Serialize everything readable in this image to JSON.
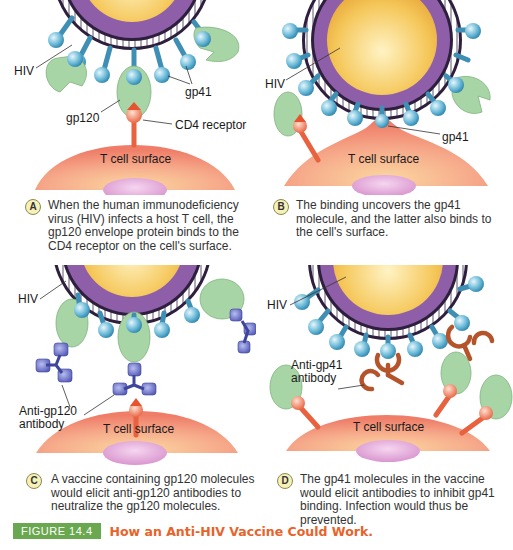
{
  "figure": {
    "number": "FIGURE 14.4",
    "title": "How an Anti-HIV Vaccine Could Work.",
    "colors": {
      "figure_number_bg": "#6aa84f",
      "title_text": "#e8632a",
      "virus_core": "#f5c75a",
      "virus_envelope": "#8e5fa8",
      "gp41": "#5aaed0",
      "gp120": "#a8d5a6",
      "cd4_receptor": "#f07a5a",
      "t_cell": "#f3937a",
      "nucleus": "#e6a6dc",
      "anti_gp120_antibody": "#6e74c8",
      "anti_gp41_antibody": "#b5532a"
    }
  },
  "panels": [
    {
      "id": "A",
      "labels": {
        "hiv": "HIV",
        "gp41": "gp41",
        "gp120": "gp120",
        "cd4": "CD4 receptor",
        "tcell": "T cell surface"
      },
      "caption": "When the human immunodeficiency virus (HIV) infects a host T cell, the gp120 envelope protein binds to the CD4 receptor on the cell's surface."
    },
    {
      "id": "B",
      "labels": {
        "hiv": "HIV",
        "gp41": "gp41",
        "tcell": "T cell surface"
      },
      "caption": "The binding uncovers the gp41 molecule, and the latter also binds to the cell's surface."
    },
    {
      "id": "C",
      "labels": {
        "hiv": "HIV",
        "antibody": "Anti-gp120 antibody",
        "tcell": "T cell surface"
      },
      "caption": "A vaccine containing gp120 molecules would elicit anti-gp120 antibodies to neutralize the gp120 molecules."
    },
    {
      "id": "D",
      "labels": {
        "hiv": "HIV",
        "antibody": "Anti-gp41 antibody",
        "tcell": "T cell surface"
      },
      "caption": "The gp41 molecules in the vaccine would elicit antibodies to inhibit gp41 binding. Infection would thus be prevented."
    }
  ]
}
